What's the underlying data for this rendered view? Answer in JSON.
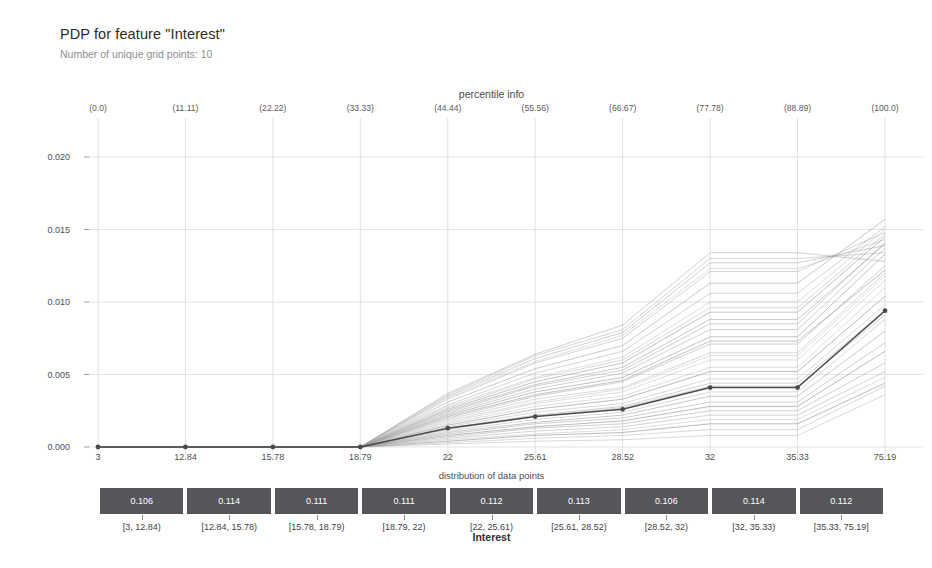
{
  "title": "PDP for feature \"Interest\"",
  "subtitle": "Number of unique grid points: 10",
  "percentile_title": "percentile info",
  "distribution_title": "distribution of data points",
  "xaxis_label": "Interest",
  "colors": {
    "pdp_line": "#4a4a4a",
    "ice_line": "#9a9a9a",
    "bar_fill": "#555659",
    "bar_text": "#ffffff",
    "grid": "#d8d8d8",
    "axis": "#8a8a8a",
    "background": "#ffffff"
  },
  "chart_data": {
    "type": "line",
    "title": "PDP for feature \"Interest\"",
    "subtitle": "Number of unique grid points: 10",
    "xlabel": "Interest",
    "ylabel": "",
    "grid": true,
    "legend": "none",
    "x_tick_labels": [
      "3",
      "12.84",
      "15.78",
      "18.79",
      "22",
      "25.61",
      "28.52",
      "32",
      "35.33",
      "75.19"
    ],
    "x_grid_values": [
      3,
      12.84,
      15.78,
      18.79,
      22,
      25.61,
      28.52,
      32,
      35.33,
      75.19
    ],
    "percentiles": [
      "(0.0)",
      "(11.11)",
      "(22.22)",
      "(33.33)",
      "(44.44)",
      "(55.56)",
      "(66.67)",
      "(77.78)",
      "(88.89)",
      "(100.0)"
    ],
    "y_tick_labels": [
      "0.000",
      "0.005",
      "0.010",
      "0.015",
      "0.020"
    ],
    "y_tick_values": [
      0.0,
      0.005,
      0.01,
      0.015,
      0.02
    ],
    "ylim": [
      -0.0009,
      0.0215
    ],
    "series": [
      {
        "name": "PDP",
        "kind": "pdp",
        "values": [
          0.0,
          0.0,
          0.0,
          0.0,
          0.0013,
          0.0021,
          0.0026,
          0.0041,
          0.0041,
          0.0094
        ]
      }
    ],
    "ice_lines": [
      [
        0.0,
        0.0,
        0.0,
        0.0,
        0.0009,
        0.0016,
        0.002,
        0.0031,
        0.0031,
        0.0072
      ],
      [
        0.0,
        0.0,
        0.0,
        0.0,
        0.0011,
        0.0019,
        0.0024,
        0.0038,
        0.0038,
        0.0088
      ],
      [
        0.0,
        0.0,
        0.0,
        0.0,
        0.0006,
        0.0011,
        0.0014,
        0.0022,
        0.0022,
        0.0052
      ],
      [
        0.0,
        0.0,
        0.0,
        0.0,
        0.0004,
        0.0008,
        0.001,
        0.0016,
        0.0016,
        0.0044
      ],
      [
        0.0,
        0.0,
        0.0,
        0.0,
        0.0016,
        0.0028,
        0.0035,
        0.0055,
        0.0055,
        0.011
      ],
      [
        0.0,
        0.0,
        0.0,
        0.0,
        0.0019,
        0.0033,
        0.0041,
        0.0065,
        0.0065,
        0.012
      ],
      [
        0.0,
        0.0,
        0.0,
        0.0,
        0.0022,
        0.0038,
        0.0048,
        0.0076,
        0.0076,
        0.0133
      ],
      [
        0.0,
        0.0,
        0.0,
        0.0,
        0.0024,
        0.0042,
        0.0053,
        0.0085,
        0.0085,
        0.0141
      ],
      [
        0.0,
        0.0,
        0.0,
        0.0,
        0.0028,
        0.0048,
        0.0062,
        0.01,
        0.01,
        0.015
      ],
      [
        0.0,
        0.0,
        0.0,
        0.0,
        0.0031,
        0.0054,
        0.007,
        0.0113,
        0.0113,
        0.0157
      ],
      [
        0.0,
        0.0,
        0.0,
        0.0,
        0.0033,
        0.0058,
        0.0075,
        0.0121,
        0.0121,
        0.0148
      ],
      [
        0.0,
        0.0,
        0.0,
        0.0,
        0.0035,
        0.0061,
        0.0079,
        0.0127,
        0.0127,
        0.0139
      ],
      [
        0.0,
        0.0,
        0.0,
        0.0,
        0.0037,
        0.0064,
        0.0084,
        0.0134,
        0.0134,
        0.0128
      ],
      [
        0.0,
        0.0,
        0.0,
        0.0,
        0.0014,
        0.0024,
        0.003,
        0.0047,
        0.0047,
        0.0098
      ],
      [
        0.0,
        0.0,
        0.0,
        0.0,
        0.0012,
        0.0021,
        0.0027,
        0.0042,
        0.0042,
        0.0091
      ],
      [
        0.0,
        0.0,
        0.0,
        0.0,
        0.0008,
        0.0014,
        0.0018,
        0.0028,
        0.0028,
        0.0066
      ],
      [
        0.0,
        0.0,
        0.0,
        0.0,
        0.0005,
        0.0009,
        0.0012,
        0.0019,
        0.0019,
        0.0048
      ],
      [
        0.0,
        0.0,
        0.0,
        0.0,
        0.0003,
        0.0006,
        0.0008,
        0.0012,
        0.0012,
        0.0042
      ],
      [
        0.0,
        0.0,
        0.0,
        0.0,
        0.0026,
        0.0045,
        0.0058,
        0.0093,
        0.0093,
        0.0145
      ],
      [
        0.0,
        0.0,
        0.0,
        0.0,
        0.002,
        0.0035,
        0.0045,
        0.0071,
        0.0071,
        0.0125
      ],
      [
        0.0,
        0.0,
        0.0,
        0.0,
        0.0017,
        0.003,
        0.0038,
        0.006,
        0.006,
        0.0115
      ],
      [
        0.0,
        0.0,
        0.0,
        0.0,
        0.001,
        0.0017,
        0.0022,
        0.0035,
        0.0035,
        0.008
      ],
      [
        0.0,
        0.0,
        0.0,
        0.0,
        0.0029,
        0.0051,
        0.0066,
        0.0106,
        0.0106,
        0.0152
      ],
      [
        0.0,
        0.0,
        0.0,
        0.0,
        0.0007,
        0.0013,
        0.0016,
        0.0025,
        0.0025,
        0.0058
      ],
      [
        0.0,
        0.0,
        0.0,
        0.0,
        0.0023,
        0.004,
        0.0051,
        0.0081,
        0.0081,
        0.0137
      ],
      [
        0.0,
        0.0,
        0.0,
        0.0,
        0.0002,
        0.0004,
        0.0005,
        0.0008,
        0.0008,
        0.0036
      ],
      [
        0.0,
        0.0,
        0.0,
        0.0,
        0.0036,
        0.0063,
        0.0081,
        0.013,
        0.013,
        0.0134
      ],
      [
        0.0,
        0.0,
        0.0,
        0.0,
        0.0015,
        0.0026,
        0.0033,
        0.0052,
        0.0052,
        0.0104
      ],
      [
        0.0,
        0.0,
        0.0,
        0.0,
        0.0034,
        0.0059,
        0.0077,
        0.0123,
        0.0123,
        0.0143
      ],
      [
        0.0,
        0.0,
        0.0,
        0.0,
        0.0027,
        0.0047,
        0.006,
        0.0096,
        0.0096,
        0.0147
      ],
      [
        0.0,
        0.0,
        0.0,
        0.0,
        0.0021,
        0.0036,
        0.0046,
        0.0073,
        0.0073,
        0.0122
      ],
      [
        0.0,
        0.0,
        0.0,
        0.0,
        0.0013,
        0.0022,
        0.0028,
        0.0044,
        0.0044,
        0.0094
      ],
      [
        0.0,
        0.0,
        0.0,
        0.0,
        0.0018,
        0.0031,
        0.004,
        0.0063,
        0.0063,
        0.0118
      ],
      [
        0.0,
        0.0,
        0.0,
        0.0,
        0.0025,
        0.0043,
        0.0055,
        0.0088,
        0.0088,
        0.014
      ]
    ]
  },
  "distribution": {
    "title": "distribution of data points",
    "bins": [
      {
        "value": "0.106",
        "range": "[3, 12.84)"
      },
      {
        "value": "0.114",
        "range": "[12.84, 15.78)"
      },
      {
        "value": "0.111",
        "range": "[15.78, 18.79)"
      },
      {
        "value": "0.111",
        "range": "[18.79, 22)"
      },
      {
        "value": "0.112",
        "range": "[22, 25.61)"
      },
      {
        "value": "0.113",
        "range": "[25.61, 28.52)"
      },
      {
        "value": "0.106",
        "range": "[28.52, 32)"
      },
      {
        "value": "0.114",
        "range": "[32, 35.33)"
      },
      {
        "value": "0.112",
        "range": "[35.33, 75.19]"
      }
    ]
  }
}
